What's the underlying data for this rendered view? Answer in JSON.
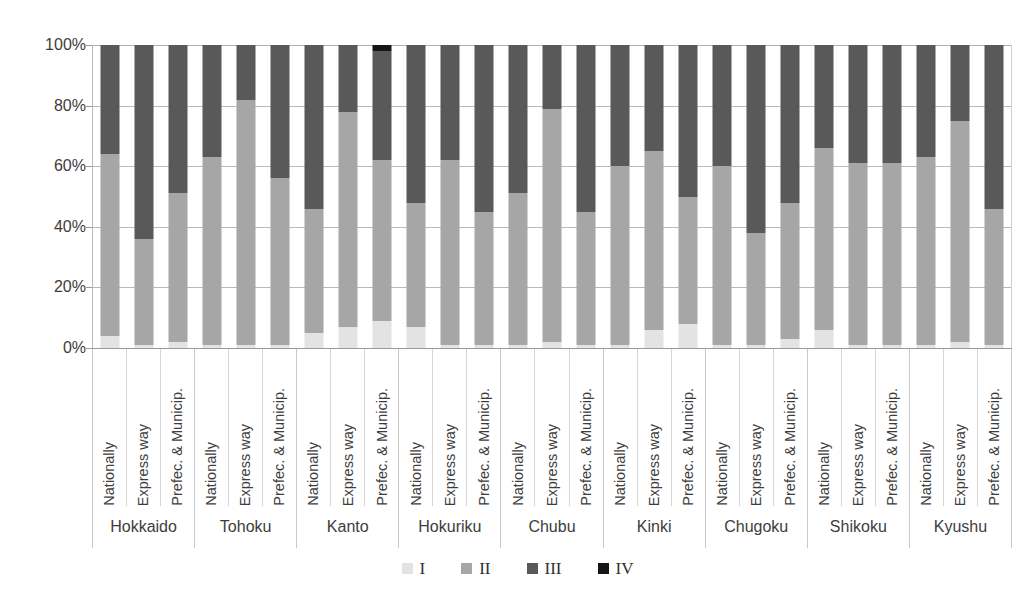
{
  "chart_data": {
    "type": "bar",
    "subtype": "stacked-percentage",
    "title": "",
    "subtitle": "",
    "xlabel": "",
    "ylabel": "",
    "ylim": [
      0,
      100
    ],
    "yticks": [
      "0%",
      "20%",
      "40%",
      "60%",
      "80%",
      "100%"
    ],
    "ytick_values": [
      0,
      20,
      40,
      60,
      80,
      100
    ],
    "grid": true,
    "legend_position": "bottom-center",
    "legend": [
      "I",
      "II",
      "III",
      "IV"
    ],
    "series": [
      {
        "name": "I",
        "color": "#e3e3e3"
      },
      {
        "name": "II",
        "color": "#a6a6a6"
      },
      {
        "name": "III",
        "color": "#595959"
      },
      {
        "name": "IV",
        "color": "#161616"
      }
    ],
    "group_label": "Region",
    "subcategories": [
      "Nationally",
      "Express way",
      "Prefec. & Municip."
    ],
    "categories": [
      "Hokkaido",
      "Tohoku",
      "Kanto",
      "Hokuriku",
      "Chubu",
      "Kinki",
      "Chugoku",
      "Shikoku",
      "Kyushu"
    ],
    "groups": [
      {
        "region": "Hokkaido",
        "bars": [
          {
            "label": "Nationally",
            "values": [
              4,
              60,
              36,
              0
            ]
          },
          {
            "label": "Express way",
            "values": [
              1,
              35,
              64,
              0
            ]
          },
          {
            "label": "Prefec. & Municip.",
            "values": [
              2,
              49,
              49,
              0
            ]
          }
        ]
      },
      {
        "region": "Tohoku",
        "bars": [
          {
            "label": "Nationally",
            "values": [
              1,
              62,
              37,
              0
            ]
          },
          {
            "label": "Express way",
            "values": [
              1,
              81,
              18,
              0
            ]
          },
          {
            "label": "Prefec. & Municip.",
            "values": [
              1,
              55,
              44,
              0
            ]
          }
        ]
      },
      {
        "region": "Kanto",
        "bars": [
          {
            "label": "Nationally",
            "values": [
              5,
              41,
              54,
              0
            ]
          },
          {
            "label": "Express way",
            "values": [
              7,
              71,
              22,
              0
            ]
          },
          {
            "label": "Prefec. & Municip.",
            "values": [
              9,
              53,
              36,
              2
            ]
          }
        ]
      },
      {
        "region": "Hokuriku",
        "bars": [
          {
            "label": "Nationally",
            "values": [
              7,
              41,
              52,
              0
            ]
          },
          {
            "label": "Express way",
            "values": [
              1,
              61,
              38,
              0
            ]
          },
          {
            "label": "Prefec. & Municip.",
            "values": [
              1,
              44,
              55,
              0
            ]
          }
        ]
      },
      {
        "region": "Chubu",
        "bars": [
          {
            "label": "Nationally",
            "values": [
              1,
              50,
              49,
              0
            ]
          },
          {
            "label": "Express way",
            "values": [
              2,
              77,
              21,
              0
            ]
          },
          {
            "label": "Prefec. & Municip.",
            "values": [
              1,
              44,
              55,
              0
            ]
          }
        ]
      },
      {
        "region": "Kinki",
        "bars": [
          {
            "label": "Nationally",
            "values": [
              1,
              59,
              40,
              0
            ]
          },
          {
            "label": "Express way",
            "values": [
              6,
              59,
              35,
              0
            ]
          },
          {
            "label": "Prefec. & Municip.",
            "values": [
              8,
              42,
              50,
              0
            ]
          }
        ]
      },
      {
        "region": "Chugoku",
        "bars": [
          {
            "label": "Nationally",
            "values": [
              1,
              59,
              40,
              0
            ]
          },
          {
            "label": "Express way",
            "values": [
              1,
              37,
              62,
              0
            ]
          },
          {
            "label": "Prefec. & Municip.",
            "values": [
              3,
              45,
              52,
              0
            ]
          }
        ]
      },
      {
        "region": "Shikoku",
        "bars": [
          {
            "label": "Nationally",
            "values": [
              6,
              60,
              34,
              0
            ]
          },
          {
            "label": "Express way",
            "values": [
              1,
              60,
              39,
              0
            ]
          },
          {
            "label": "Prefec. & Municip.",
            "values": [
              1,
              60,
              39,
              0
            ]
          }
        ]
      },
      {
        "region": "Kyushu",
        "bars": [
          {
            "label": "Nationally",
            "values": [
              1,
              62,
              37,
              0
            ]
          },
          {
            "label": "Express way",
            "values": [
              2,
              73,
              25,
              0
            ]
          },
          {
            "label": "Prefec. & Municip.",
            "values": [
              1,
              45,
              54,
              0
            ]
          }
        ]
      }
    ]
  }
}
